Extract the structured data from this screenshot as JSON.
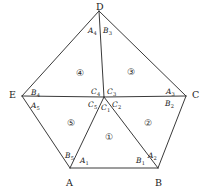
{
  "figure": {
    "type": "geometry-diagram",
    "shape": "pentagon",
    "stroke_color": "#3a3a3a",
    "background_color": "#ffffff",
    "text_color": "#1a1a1a"
  },
  "vertices": [
    {
      "name": "D",
      "label": "D",
      "x": 99,
      "y": 11
    },
    {
      "name": "E",
      "label": "E",
      "x": 22,
      "y": 96
    },
    {
      "name": "C",
      "label": "C",
      "x": 186,
      "y": 96
    },
    {
      "name": "A",
      "label": "A",
      "x": 70,
      "y": 168
    },
    {
      "name": "B",
      "label": "B",
      "x": 158,
      "y": 168
    }
  ],
  "center": {
    "name": "center-node",
    "x": 104,
    "y": 97
  },
  "vertex_labels": {
    "D": {
      "text": "D",
      "x": 96,
      "y": 2
    },
    "E": {
      "text": "E",
      "x": 9,
      "y": 90
    },
    "C": {
      "text": "C",
      "x": 192,
      "y": 90
    },
    "A": {
      "text": "A",
      "x": 66,
      "y": 178
    },
    "B": {
      "text": "B",
      "x": 155,
      "y": 178
    }
  },
  "angle_labels": [
    {
      "name": "angle-A1",
      "letter": "A",
      "sub": "1",
      "x": 80,
      "y": 157
    },
    {
      "name": "angle-A2",
      "letter": "A",
      "sub": "2",
      "x": 148,
      "y": 152
    },
    {
      "name": "angle-A3",
      "letter": "A",
      "sub": "3",
      "x": 166,
      "y": 88
    },
    {
      "name": "angle-A4",
      "letter": "A",
      "sub": "4",
      "x": 88,
      "y": 27
    },
    {
      "name": "angle-A5",
      "letter": "A",
      "sub": "5",
      "x": 31,
      "y": 102
    },
    {
      "name": "angle-B1",
      "letter": "B",
      "sub": "1",
      "x": 136,
      "y": 157
    },
    {
      "name": "angle-B2",
      "letter": "B",
      "sub": "2",
      "x": 165,
      "y": 100
    },
    {
      "name": "angle-B3",
      "letter": "B",
      "sub": "3",
      "x": 103,
      "y": 27
    },
    {
      "name": "angle-B4",
      "letter": "B",
      "sub": "4",
      "x": 31,
      "y": 89
    },
    {
      "name": "angle-B5",
      "letter": "B",
      "sub": "5",
      "x": 65,
      "y": 152
    },
    {
      "name": "angle-C1",
      "letter": "C",
      "sub": "1",
      "x": 101,
      "y": 104
    },
    {
      "name": "angle-C2",
      "letter": "C",
      "sub": "2",
      "x": 112,
      "y": 101
    },
    {
      "name": "angle-C3",
      "letter": "C",
      "sub": "3",
      "x": 107,
      "y": 88
    },
    {
      "name": "angle-C4",
      "letter": "C",
      "sub": "4",
      "x": 91,
      "y": 88
    },
    {
      "name": "angle-C5",
      "letter": "C",
      "sub": "5",
      "x": 88,
      "y": 101
    }
  ],
  "regions": [
    {
      "name": "region-1",
      "label": "①",
      "x": 105,
      "y": 133
    },
    {
      "name": "region-2",
      "label": "②",
      "x": 144,
      "y": 119
    },
    {
      "name": "region-3",
      "label": "③",
      "x": 127,
      "y": 68
    },
    {
      "name": "region-4",
      "label": "④",
      "x": 76,
      "y": 69
    },
    {
      "name": "region-5",
      "label": "⑤",
      "x": 67,
      "y": 119
    }
  ],
  "edges": [
    {
      "name": "edge-A-B",
      "from": "A",
      "to": "B"
    },
    {
      "name": "edge-B-C",
      "from": "B",
      "to": "C"
    },
    {
      "name": "edge-C-D",
      "from": "C",
      "to": "D"
    },
    {
      "name": "edge-D-E",
      "from": "D",
      "to": "E"
    },
    {
      "name": "edge-E-A",
      "from": "E",
      "to": "A"
    },
    {
      "name": "cevian-A-center",
      "from": "A",
      "to": "center"
    },
    {
      "name": "cevian-B-center",
      "from": "B",
      "to": "center"
    },
    {
      "name": "cevian-C-center",
      "from": "C",
      "to": "center"
    },
    {
      "name": "cevian-D-center",
      "from": "D",
      "to": "center"
    },
    {
      "name": "cevian-E-center",
      "from": "E",
      "to": "center"
    }
  ]
}
